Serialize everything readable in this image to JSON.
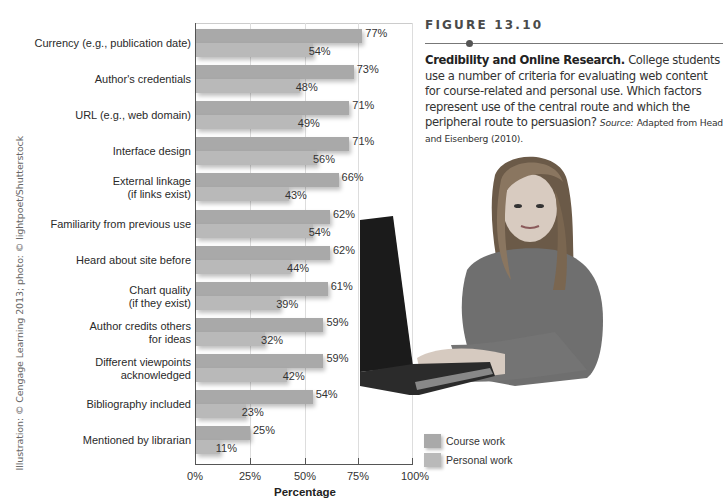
{
  "figure": {
    "label": "FIGURE 13.10",
    "title": "Credibility and Online Research.",
    "body": "College students use a number of criteria for evaluating web content for course-related and personal use. Which factors represent use of the central route and which the peripheral route to persuasion?",
    "source_label": "Source:",
    "source_text": "Adapted from Head and Eisenberg (2010)."
  },
  "credit": "Illustration: © Cengage Learning 2013; photo: © lightpoet/Shutterstock",
  "legend": {
    "course": "Course work",
    "personal": "Personal work"
  },
  "colors": {
    "course": "#a9a9a9",
    "personal": "#b9b9b9"
  },
  "axis": {
    "ticks": [
      "0%",
      "25%",
      "50%",
      "75%",
      "100%"
    ],
    "xlabel": "Percentage"
  },
  "chart_data": {
    "type": "bar",
    "orientation": "horizontal",
    "title": "Credibility and Online Research",
    "xlabel": "Percentage",
    "ylabel": "",
    "xlim": [
      0,
      100
    ],
    "grid": true,
    "legend_position": "bottom-right",
    "categories": [
      "Currency (e.g., publication date)",
      "Author's credentials",
      "URL (e.g., web domain)",
      "Interface design",
      "External linkage (if links exist)",
      "Familiarity from previous use",
      "Heard about site before",
      "Chart quality (if they exist)",
      "Author credits others for ideas",
      "Different viewpoints acknowledged",
      "Bibliography included",
      "Mentioned by librarian"
    ],
    "series": [
      {
        "name": "Course work",
        "values": [
          77,
          73,
          71,
          71,
          66,
          62,
          62,
          61,
          59,
          59,
          54,
          25
        ]
      },
      {
        "name": "Personal work",
        "values": [
          54,
          48,
          49,
          56,
          43,
          54,
          44,
          39,
          32,
          42,
          23,
          11
        ]
      }
    ]
  },
  "rows": [
    {
      "label1": "Currency (e.g., publication date)",
      "label2": "",
      "course": 77,
      "personal": 54,
      "course_txt": "77%",
      "personal_txt": "54%"
    },
    {
      "label1": "Author's credentials",
      "label2": "",
      "course": 73,
      "personal": 48,
      "course_txt": "73%",
      "personal_txt": "48%"
    },
    {
      "label1": "URL (e.g., web domain)",
      "label2": "",
      "course": 71,
      "personal": 49,
      "course_txt": "71%",
      "personal_txt": "49%"
    },
    {
      "label1": "Interface design",
      "label2": "",
      "course": 71,
      "personal": 56,
      "course_txt": "71%",
      "personal_txt": "56%"
    },
    {
      "label1": "External linkage",
      "label2": "(if links exist)",
      "course": 66,
      "personal": 43,
      "course_txt": "66%",
      "personal_txt": "43%"
    },
    {
      "label1": "Familiarity from previous use",
      "label2": "",
      "course": 62,
      "personal": 54,
      "course_txt": "62%",
      "personal_txt": "54%"
    },
    {
      "label1": "Heard about site before",
      "label2": "",
      "course": 62,
      "personal": 44,
      "course_txt": "62%",
      "personal_txt": "44%"
    },
    {
      "label1": "Chart quality",
      "label2": "(if they exist)",
      "course": 61,
      "personal": 39,
      "course_txt": "61%",
      "personal_txt": "39%"
    },
    {
      "label1": "Author credits others",
      "label2": "for ideas",
      "course": 59,
      "personal": 32,
      "course_txt": "59%",
      "personal_txt": "32%"
    },
    {
      "label1": "Different viewpoints",
      "label2": "acknowledged",
      "course": 59,
      "personal": 42,
      "course_txt": "59%",
      "personal_txt": "42%"
    },
    {
      "label1": "Bibliography included",
      "label2": "",
      "course": 54,
      "personal": 23,
      "course_txt": "54%",
      "personal_txt": "23%"
    },
    {
      "label1": "Mentioned by librarian",
      "label2": "",
      "course": 25,
      "personal": 11,
      "course_txt": "25%",
      "personal_txt": "11%"
    }
  ],
  "photo": {
    "description": "student-with-laptop-photo"
  }
}
